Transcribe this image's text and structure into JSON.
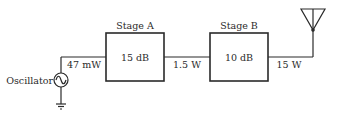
{
  "diagram": {
    "oscillator": {
      "label": "Oscillator",
      "symbol": "ac-source-icon"
    },
    "stages": [
      {
        "title": "Stage A",
        "gain": "15 dB"
      },
      {
        "title": "Stage B",
        "gain": "10 dB"
      }
    ],
    "signal_levels": [
      {
        "label": "47 mW",
        "position": "oscillator-to-stage-a"
      },
      {
        "label": "1.5 W",
        "position": "stage-a-to-stage-b"
      },
      {
        "label": "15 W",
        "position": "stage-b-to-antenna"
      }
    ],
    "antenna": {
      "symbol": "antenna-icon"
    },
    "ground": {
      "symbol": "ground-icon"
    },
    "colors": {
      "line": "#2a2a2a",
      "background": "#ffffff"
    }
  }
}
